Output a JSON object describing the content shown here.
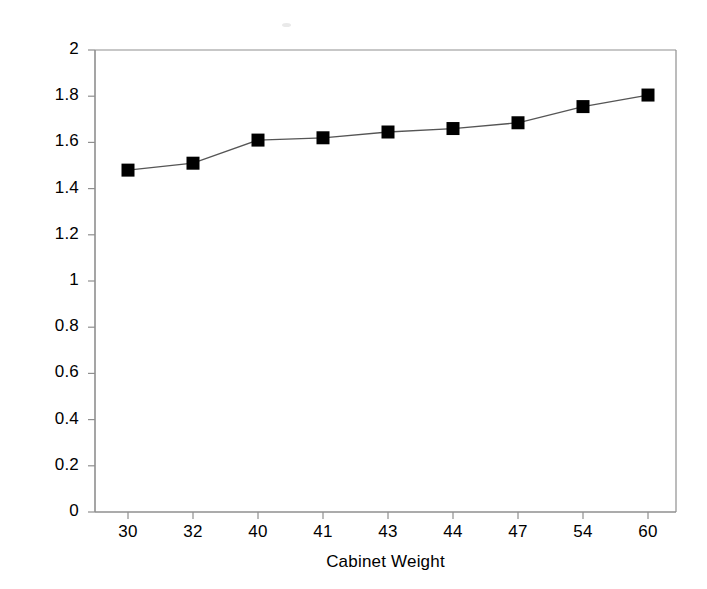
{
  "figure": {
    "background_color": "#ffffff",
    "frame_color": "#8f8f8f",
    "series_color": "#000000"
  },
  "axes": {
    "y_title": "Log(Frequency)",
    "x_title": "Cabinet Weight",
    "y_ticks": [
      "0",
      "0.2",
      "0.4",
      "0.6",
      "0.8",
      "1",
      "1.2",
      "1.4",
      "1.6",
      "1.8",
      "2"
    ],
    "x_ticks": [
      "30",
      "32",
      "40",
      "41",
      "43",
      "44",
      "47",
      "54",
      "60"
    ]
  },
  "chart_data": {
    "type": "line",
    "title": "",
    "xlabel": "Cabinet Weight",
    "ylabel": "Log(Frequency)",
    "categories": [
      "30",
      "32",
      "40",
      "41",
      "43",
      "44",
      "47",
      "54",
      "60"
    ],
    "values": [
      1.48,
      1.51,
      1.61,
      1.62,
      1.645,
      1.66,
      1.685,
      1.755,
      1.805
    ],
    "series": [
      {
        "name": "Log(Frequency)",
        "values": [
          1.48,
          1.51,
          1.61,
          1.62,
          1.645,
          1.66,
          1.685,
          1.755,
          1.805
        ],
        "marker": "square",
        "marker_color": "#000000",
        "line_color": "#555555"
      }
    ],
    "ylim": [
      0,
      2
    ],
    "ytick_step": 0.2,
    "grid": false,
    "legend": false,
    "legend_position": "none"
  }
}
